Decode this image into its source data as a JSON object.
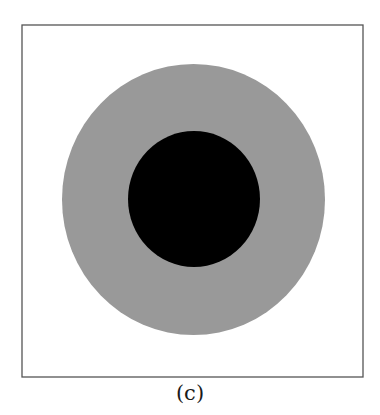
{
  "figure": {
    "caption": "(c)",
    "frame": {
      "x": 22,
      "y": 25,
      "width": 341,
      "height": 352,
      "stroke": "#555555"
    },
    "outer_circle": {
      "cx": 193.5,
      "cy": 199.5,
      "rx": 131.5,
      "ry": 135.5,
      "fill": "#999999",
      "label": "gray-disk"
    },
    "inner_circle": {
      "cx": 194,
      "cy": 199,
      "rx": 66,
      "ry": 68,
      "fill": "#000000",
      "label": "black-core"
    }
  }
}
